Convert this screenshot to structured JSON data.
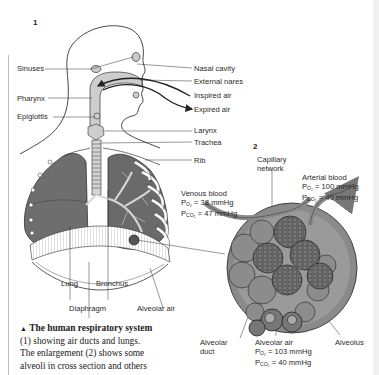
{
  "figure": {
    "panel1_number": "1",
    "panel2_number": "2",
    "labels_left": {
      "sinuses": "Sinuses",
      "pharynx": "Pharynx",
      "epiglottis": "Epiglottis"
    },
    "labels_right": {
      "nasal_cavity": "Nasal cavity",
      "external_nares": "External nares",
      "inspired_air": "Inspired air",
      "expired_air": "Expired air",
      "larynx": "Larynx",
      "trachea": "Trachea",
      "rib": "Rib"
    },
    "labels_bottom": {
      "lung": "Lung",
      "bronchus": "Bronchus",
      "diaphragm": "Diaphragm",
      "alveolar_air": "Alveolar air"
    },
    "enlargement": {
      "capillary_network_line1": "Capillary",
      "capillary_network_line2": "network",
      "venous_blood": {
        "title": "Venous blood",
        "po2_label": "P",
        "po2_sub": "O₂",
        "po2_value": "= 38 mmHg",
        "pco2_label": "P",
        "pco2_sub": "CO₂",
        "pco2_value": "= 47 mmHg"
      },
      "arterial_blood": {
        "title": "Arterial blood",
        "po2_label": "P",
        "po2_sub": "O₂",
        "po2_value": "= 100 mmHg",
        "pco2_label": "P",
        "pco2_sub": "CO₂",
        "pco2_value": "= 40 mmHg"
      },
      "alveolar_air": {
        "title": "Alveolar air",
        "po2_label": "P",
        "po2_sub": "O₂",
        "po2_value": "= 103 mmHg",
        "pco2_label": "P",
        "pco2_sub": "CO₂",
        "pco2_value": "= 40 mmHg"
      },
      "alveolar_duct_line1": "Alveolar",
      "alveolar_duct_line2": "duct",
      "alveolus": "Alveolus"
    }
  },
  "caption": {
    "marker": "▲",
    "title": "The human respiratory system",
    "line2": "(1) showing air ducts and lungs.",
    "line3": "The enlargement (2) shows some",
    "line4": "alveoli in cross section and others"
  },
  "colors": {
    "lung_dark": "#6e6e6e",
    "airway_gray": "#c9c9c9",
    "circle_gray": "#8a8a8a",
    "line": "#333333"
  }
}
